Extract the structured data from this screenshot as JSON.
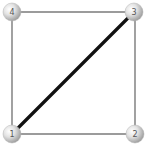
{
  "diagram": {
    "type": "graph",
    "nodes": [
      {
        "id": "1",
        "label": "1",
        "x": 12,
        "y": 134
      },
      {
        "id": "2",
        "label": "2",
        "x": 135,
        "y": 134
      },
      {
        "id": "3",
        "label": "3",
        "x": 134,
        "y": 12
      },
      {
        "id": "4",
        "label": "4",
        "x": 12,
        "y": 12
      }
    ],
    "edges": [
      {
        "from": "1",
        "to": "2",
        "style": "thin"
      },
      {
        "from": "2",
        "to": "3",
        "style": "thin"
      },
      {
        "from": "3",
        "to": "4",
        "style": "thin"
      },
      {
        "from": "4",
        "to": "1",
        "style": "thin"
      },
      {
        "from": "1",
        "to": "3",
        "style": "thick"
      }
    ],
    "colors": {
      "thin_edge": "#7a7a7a",
      "thick_edge": "#111111",
      "node_fill_light": "#f4f4f4",
      "node_fill_dark": "#a8a8a8",
      "label": "#555555"
    }
  }
}
